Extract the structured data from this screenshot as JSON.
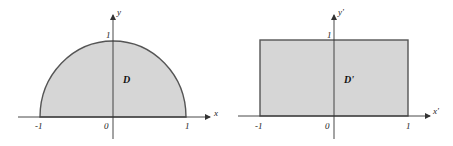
{
  "colors": {
    "fill": "#d6d6d6",
    "stroke": "#555555",
    "axis": "#333333"
  },
  "left_diagram": {
    "shape": "semicircle",
    "region_label": "D",
    "x_axis_label": "x",
    "y_axis_label": "y",
    "tick_labels": {
      "x_neg": "-1",
      "origin": "0",
      "x_pos": "1",
      "y_top": "1"
    }
  },
  "right_diagram": {
    "shape": "rectangle",
    "region_label": "D'",
    "x_axis_label": "x'",
    "y_axis_label": "y'",
    "tick_labels": {
      "x_neg": "-1",
      "origin": "0",
      "x_pos": "1",
      "y_top": "1"
    }
  }
}
